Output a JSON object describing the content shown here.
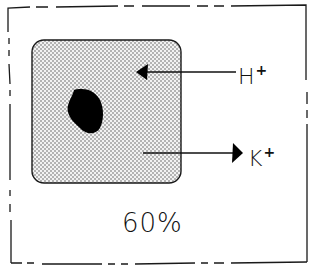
{
  "diagram": {
    "frame": {
      "style": "dashed-border",
      "color": "#1a1a1a"
    },
    "cell": {
      "fill": "stippled-gray",
      "nucleus": "black-blob",
      "color": "#111111"
    },
    "arrows": [
      {
        "ion": "H",
        "charge": "+",
        "direction": "into-cell"
      },
      {
        "ion": "K",
        "charge": "+",
        "direction": "out-of-cell"
      }
    ],
    "percentage_label": "60%"
  }
}
